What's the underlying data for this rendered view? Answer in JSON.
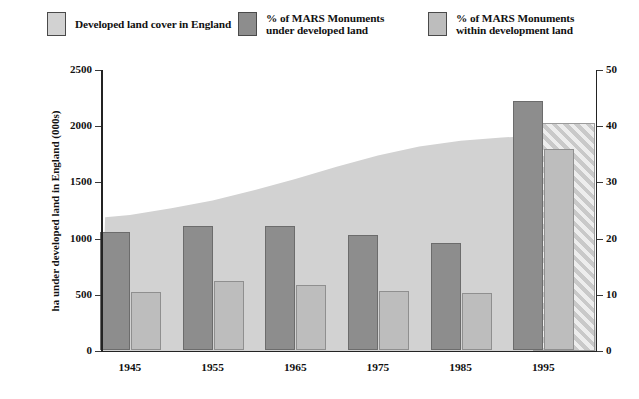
{
  "legend": {
    "items": [
      {
        "label": "Developed land cover in England",
        "color": "#d2d2d2",
        "icon": "legend-swatch-area"
      },
      {
        "label": "% of MARS Monuments\nunder developed land",
        "color": "#8d8d8d",
        "icon": "legend-swatch-under"
      },
      {
        "label": "% of MARS Monuments\nwithin development land",
        "color": "#bdbdbd",
        "icon": "legend-swatch-within"
      }
    ]
  },
  "chart_data": {
    "type": "bar",
    "title": "",
    "subtitle": "",
    "xlabel": "",
    "ylabel": "ha under developed land in England (000s)",
    "y2label": "percentage of MARS Monuments under and within developed land",
    "categories": [
      "1945",
      "1955",
      "1965",
      "1975",
      "1985",
      "1995"
    ],
    "ylim": [
      0,
      2500
    ],
    "yticks": [
      "0",
      "500",
      "1000",
      "1500",
      "2000",
      "2500"
    ],
    "ytick_values": [
      0,
      500,
      1000,
      1500,
      2000,
      2500
    ],
    "y2lim": [
      0,
      50
    ],
    "y2ticks": [
      "0",
      "10",
      "20",
      "30",
      "40",
      "50"
    ],
    "y2tick_values": [
      0,
      10,
      20,
      30,
      40,
      50
    ],
    "grid": false,
    "legend_position": "top",
    "series": [
      {
        "name": "% of MARS Monuments under developed land",
        "type": "bar",
        "axis": "right",
        "color": "#8d8d8d",
        "values": [
          21.0,
          22.0,
          22.1,
          20.4,
          19.0,
          44.4
        ]
      },
      {
        "name": "% of MARS Monuments within development land",
        "type": "bar",
        "axis": "right",
        "color": "#bdbdbd",
        "values": [
          10.3,
          12.2,
          11.6,
          10.5,
          10.1,
          35.8
        ]
      },
      {
        "name": "Developed land cover in England",
        "type": "area",
        "axis": "left",
        "color": "#d2d2d2",
        "x": [
          1942,
          1945,
          1950,
          1955,
          1960,
          1965,
          1970,
          1975,
          1980,
          1985,
          1990,
          1995,
          2000
        ],
        "values": [
          1190,
          1210,
          1270,
          1340,
          1430,
          1530,
          1640,
          1740,
          1820,
          1870,
          1900,
          1915,
          1920
        ]
      }
    ],
    "annotations": [
      {
        "name": "projection-hatched-zone",
        "label": "",
        "from_x": 1996,
        "to_x": 2001,
        "note": "diagonal-hatched region at right edge"
      }
    ]
  }
}
